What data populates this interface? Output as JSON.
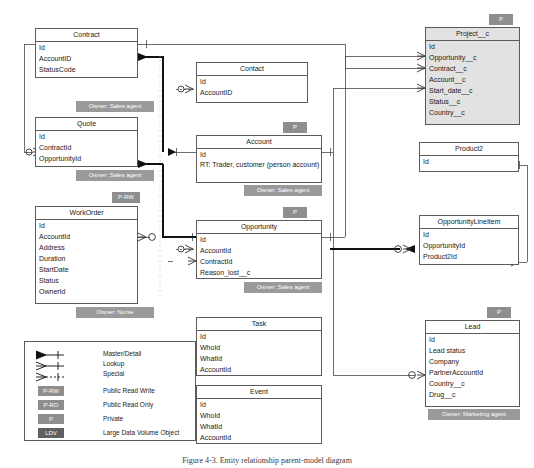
{
  "diagram": {
    "caption": "Figure 4-3.  Entity relationship parent-model diagram",
    "colors": {
      "entity_border": "#5b5b5b",
      "entity_fill": "#ffffff",
      "entity_shaded_fill": "#e2e2e2",
      "badge_gray": "#8e8e8e",
      "badge_dark": "#5f5f5f",
      "connector": "#4a4a4a",
      "connector_bold": "#111111"
    }
  },
  "entities": [
    {
      "name": "Contract",
      "fields": [
        "Id",
        "AccountID",
        "StatusCode"
      ],
      "shaded": false,
      "badge": null,
      "owner": "Owner: Sales agent"
    },
    {
      "name": "Quote",
      "fields": [
        "Id",
        "ContractId",
        "OpportunityId"
      ],
      "shaded": false,
      "badge": null,
      "owner": "Owner: Sales agent"
    },
    {
      "name": "WorkOrder",
      "fields": [
        "Id",
        "AccountId",
        "Address",
        "Duration",
        "StartDate",
        "Status",
        "OwnerId"
      ],
      "shaded": false,
      "badge": "P-RW",
      "owner": "Owner: Nurse"
    },
    {
      "name": "Contact",
      "fields": [
        "Id",
        "AccountID"
      ],
      "shaded": false,
      "badge": null,
      "owner": null
    },
    {
      "name": "Account",
      "fields": [
        "Id",
        "RT: Trader, customer (person account)"
      ],
      "shaded": false,
      "badge": "P",
      "owner": "Owner: Sales agent"
    },
    {
      "name": "Opportunity",
      "fields": [
        "Id",
        "AccountId",
        "ContractId",
        "Reason_lost__c"
      ],
      "shaded": false,
      "badge": "P",
      "owner": "Owner: Sales agent"
    },
    {
      "name": "Task",
      "fields": [
        "Id",
        "WhoId",
        "WhatId",
        "AccountId"
      ],
      "shaded": false,
      "badge": null,
      "owner": null
    },
    {
      "name": "Event",
      "fields": [
        "Id",
        "WhoId",
        "WhatId",
        "AccountId"
      ],
      "shaded": false,
      "badge": null,
      "owner": null
    },
    {
      "name": "Project__c",
      "fields": [
        "Id",
        "Opportunity__c",
        "Contract__c",
        "Account__c",
        "Start_date__c",
        "Status__c",
        "Country__c"
      ],
      "shaded": true,
      "badge": "P",
      "owner": null
    },
    {
      "name": "Product2",
      "fields": [
        "Id"
      ],
      "shaded": false,
      "badge": null,
      "owner": null
    },
    {
      "name": "OpportunityLineItem",
      "fields": [
        "Id",
        "OpportunityId",
        "Product2Id"
      ],
      "shaded": false,
      "badge": null,
      "owner": null
    },
    {
      "name": "Lead",
      "fields": [
        "Id",
        "Lead status",
        "Company",
        "PartnerAccountId",
        "Country__c",
        "Drug__c"
      ],
      "shaded": false,
      "badge": "P",
      "owner": "Owner: Marketing agent"
    }
  ],
  "legend": {
    "relationships": [
      {
        "key": "master-detail",
        "label": "Master/Detail"
      },
      {
        "key": "lookup",
        "label": "Lookup"
      },
      {
        "key": "special",
        "label": "Special"
      }
    ],
    "sharing": [
      {
        "badge": "P-RW",
        "label": "Public Read Write",
        "dark": false
      },
      {
        "badge": "P-RO",
        "label": "Public Read Only",
        "dark": false
      },
      {
        "badge": "P",
        "label": "Private",
        "dark": false
      },
      {
        "badge": "LDV",
        "label": "Large Data Volume Object",
        "dark": true
      }
    ]
  }
}
